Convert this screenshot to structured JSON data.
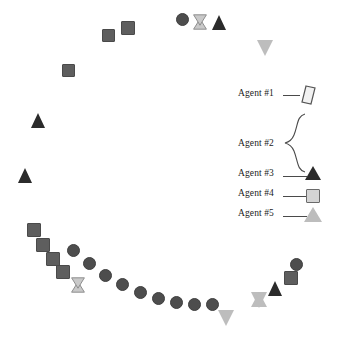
{
  "figure": {
    "title": "",
    "background": "#ffffff",
    "width": 347,
    "height": 351
  },
  "legend": {
    "items": [
      {
        "id": "agent1",
        "label": "Agent #1",
        "marker": "parallelogram",
        "color": "#f2f2f2",
        "stroke": "#555555",
        "leader": "line"
      },
      {
        "id": "agent2",
        "label": "Agent #2",
        "marker": "circle",
        "color": "#4d4d4d",
        "stroke": "#3a3a3a",
        "leader": "brace"
      },
      {
        "id": "agent3",
        "label": "Agent #3",
        "marker": "triangle-up",
        "color": "#2b2b2b",
        "stroke": "#2b2b2b",
        "leader": "line"
      },
      {
        "id": "agent4",
        "label": "Agent #4",
        "marker": "square",
        "color": "#d4d4d4",
        "stroke": "#6a6a6a",
        "leader": "line"
      },
      {
        "id": "agent5",
        "label": "Agent #5",
        "marker": "triangle-up",
        "color": "#bdbdbd",
        "stroke": "#8a8a8a",
        "leader": "line"
      }
    ]
  },
  "colors": {
    "circle_dark": "#4d4d4d",
    "circle_stroke": "#3f3f3f",
    "square_dark": "#5e5e5e",
    "square_stroke": "#4a4a4a",
    "square_light": "#d4d4d4",
    "square_light_stroke": "#6a6a6a",
    "triangle_dark": "#2b2b2b",
    "triangle_light": "#bdbdbd",
    "triangle_light_stroke": "#8a8a8a",
    "hourglass_light": "#c9c9c9",
    "hourglass_stroke": "#8a8a8a",
    "parallelogram_fill": "#f2f2f2",
    "parallelogram_stroke": "#555555",
    "text": "#1a1a1a",
    "leader_line": "#4a4a4a"
  },
  "chart_data": {
    "type": "scatter",
    "title": "",
    "xlabel": "",
    "ylabel": "",
    "grid": false,
    "legend_position": "right-middle",
    "axis_visible": false,
    "xlim": [
      0,
      347
    ],
    "ylim": [
      0,
      351
    ],
    "series": [
      {
        "name": "Agent #1",
        "marker": "parallelogram",
        "color": "#f2f2f2",
        "points": []
      },
      {
        "name": "Agent #2",
        "marker": "circle",
        "color": "#4d4d4d",
        "points": [
          {
            "x": 182,
            "y": 19,
            "size": 13
          },
          {
            "x": 73,
            "y": 250,
            "size": 13
          },
          {
            "x": 89,
            "y": 263,
            "size": 13
          },
          {
            "x": 105,
            "y": 275,
            "size": 13
          },
          {
            "x": 122,
            "y": 284,
            "size": 13
          },
          {
            "x": 140,
            "y": 292,
            "size": 13
          },
          {
            "x": 158,
            "y": 298,
            "size": 13
          },
          {
            "x": 176,
            "y": 302,
            "size": 13
          },
          {
            "x": 194,
            "y": 304,
            "size": 13
          },
          {
            "x": 212,
            "y": 304,
            "size": 13
          },
          {
            "x": 296,
            "y": 264,
            "size": 13
          }
        ]
      },
      {
        "name": "Agent #3",
        "marker": "triangle-up",
        "color": "#2b2b2b",
        "points": [
          {
            "x": 219,
            "y": 22,
            "size": 15
          },
          {
            "x": 38,
            "y": 120,
            "size": 15
          },
          {
            "x": 25,
            "y": 175,
            "size": 15
          },
          {
            "x": 275,
            "y": 288,
            "size": 15
          }
        ]
      },
      {
        "name": "Agent #4",
        "marker": "square",
        "color": "#5e5e5e",
        "points": [
          {
            "x": 108,
            "y": 35,
            "size": 13
          },
          {
            "x": 128,
            "y": 28,
            "size": 14
          },
          {
            "x": 68,
            "y": 70,
            "size": 13
          },
          {
            "x": 34,
            "y": 230,
            "size": 14
          },
          {
            "x": 43,
            "y": 245,
            "size": 14
          },
          {
            "x": 53,
            "y": 259,
            "size": 14
          },
          {
            "x": 63,
            "y": 272,
            "size": 14
          },
          {
            "x": 291,
            "y": 278,
            "size": 14
          }
        ]
      },
      {
        "name": "Agent #5",
        "marker": "triangle-down",
        "color": "#bdbdbd",
        "points": [
          {
            "x": 265,
            "y": 48,
            "size": 16
          },
          {
            "x": 226,
            "y": 318,
            "size": 16
          },
          {
            "x": 259,
            "y": 300,
            "size": 16
          }
        ]
      },
      {
        "name": "Overlap (hourglass)",
        "marker": "hourglass",
        "color": "#c9c9c9",
        "points": [
          {
            "x": 200,
            "y": 22,
            "size": 16
          },
          {
            "x": 78,
            "y": 285,
            "size": 16
          }
        ]
      }
    ]
  }
}
